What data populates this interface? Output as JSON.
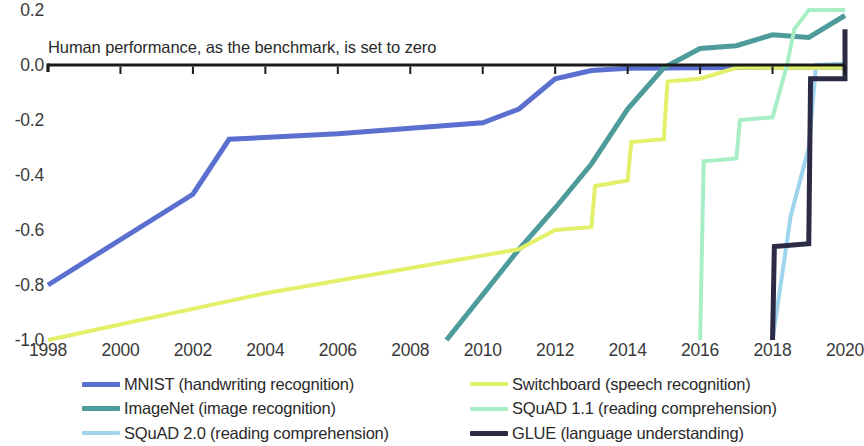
{
  "chart_data": {
    "type": "line",
    "title": "",
    "subtitle": "",
    "annotation": "Human performance, as the benchmark, is set to zero",
    "xlabel": "",
    "ylabel": "",
    "xlim": [
      1998,
      2020
    ],
    "ylim": [
      -1.0,
      0.2
    ],
    "grid": false,
    "legend_position": "bottom",
    "xticks": [
      "1998",
      "2000",
      "2002",
      "2004",
      "2006",
      "2008",
      "2010",
      "2012",
      "2014",
      "2016",
      "2018",
      "2020"
    ],
    "xtick_values": [
      1998,
      2000,
      2002,
      2004,
      2006,
      2008,
      2010,
      2012,
      2014,
      2016,
      2018,
      2020
    ],
    "yticks": [
      "0.2",
      "0.0",
      "-0.2",
      "-0.4",
      "-0.6",
      "-0.8",
      "-1.0"
    ],
    "ytick_values": [
      0.2,
      0.0,
      -0.2,
      -0.4,
      -0.6,
      -0.8,
      -1.0
    ],
    "zero_line": 0.0,
    "series": [
      {
        "name": "MNIST (handwriting recognition)",
        "color": "#5b6fd0",
        "x": [
          1998,
          2002,
          2003,
          2006,
          2010,
          2011,
          2012,
          2013,
          2014,
          2016,
          2018,
          2020
        ],
        "y": [
          -0.8,
          -0.47,
          -0.27,
          -0.25,
          -0.21,
          -0.16,
          -0.05,
          -0.02,
          -0.012,
          -0.01,
          -0.008,
          -0.008
        ]
      },
      {
        "name": "ImageNet (image recognition)",
        "color": "#4d9b9b",
        "x": [
          2009,
          2011,
          2012,
          2013,
          2014,
          2015,
          2016,
          2017,
          2018,
          2019,
          2020
        ],
        "y": [
          -1.0,
          -0.67,
          -0.52,
          -0.36,
          -0.16,
          -0.01,
          0.06,
          0.07,
          0.11,
          0.1,
          0.18
        ]
      },
      {
        "name": "SQuAD 2.0 (reading comprehension)",
        "color": "#9fd4ef",
        "x": [
          2018,
          2018.5,
          2019,
          2019.2,
          2020
        ],
        "y": [
          -1.0,
          -0.55,
          -0.3,
          0.0,
          0.005
        ]
      },
      {
        "name": "Switchboard (speech recognition)",
        "color": "#e3f06a",
        "x": [
          1998,
          2004,
          2011,
          2012,
          2013,
          2013.1,
          2014,
          2014.1,
          2015,
          2015.1,
          2016,
          2017,
          2020
        ],
        "y": [
          -1.0,
          -0.83,
          -0.67,
          -0.6,
          -0.59,
          -0.44,
          -0.42,
          -0.28,
          -0.27,
          -0.06,
          -0.05,
          -0.01,
          -0.01
        ]
      },
      {
        "name": "SQuAD 1.1 (reading comprehension)",
        "color": "#a8eec4",
        "x": [
          2016,
          2016.1,
          2017,
          2017.1,
          2018,
          2018.4,
          2018.6,
          2019,
          2020
        ],
        "y": [
          -1.0,
          -0.35,
          -0.34,
          -0.2,
          -0.19,
          0.0,
          0.13,
          0.2,
          0.2
        ]
      },
      {
        "name": "GLUE (language understanding)",
        "color": "#2b2b45",
        "x": [
          2018,
          2018.05,
          2019,
          2019.05,
          2020,
          2020.0
        ],
        "y": [
          -1.0,
          -0.66,
          -0.65,
          -0.05,
          -0.05,
          0.13
        ]
      }
    ]
  },
  "axis": {
    "yticks": [
      {
        "label": "0.2",
        "value": 0.2
      },
      {
        "label": "0.0",
        "value": 0.0
      },
      {
        "label": "-0.2",
        "value": -0.2
      },
      {
        "label": "-0.4",
        "value": -0.4
      },
      {
        "label": "-0.6",
        "value": -0.6
      },
      {
        "label": "-0.8",
        "value": -0.8
      },
      {
        "label": "-1.0",
        "value": -1.0
      }
    ],
    "xticks": [
      {
        "label": "1998",
        "value": 1998
      },
      {
        "label": "2000",
        "value": 2000
      },
      {
        "label": "2002",
        "value": 2002
      },
      {
        "label": "2004",
        "value": 2004
      },
      {
        "label": "2006",
        "value": 2006
      },
      {
        "label": "2008",
        "value": 2008
      },
      {
        "label": "2010",
        "value": 2010
      },
      {
        "label": "2012",
        "value": 2012
      },
      {
        "label": "2014",
        "value": 2014
      },
      {
        "label": "2016",
        "value": 2016
      },
      {
        "label": "2018",
        "value": 2018
      },
      {
        "label": "2020",
        "value": 2020
      }
    ]
  },
  "annotation": {
    "text": "Human performance, as the benchmark, is set to zero"
  },
  "legend": {
    "left_column": [
      {
        "label": "MNIST (handwriting recognition)",
        "color": "#5b6fd0",
        "thickness": 5
      },
      {
        "label": "ImageNet (image recognition)",
        "color": "#4d9b9b",
        "thickness": 5
      },
      {
        "label": "SQuAD 2.0 (reading comprehension)",
        "color": "#9fd4ef",
        "thickness": 4
      }
    ],
    "right_column": [
      {
        "label": "Switchboard (speech recognition)",
        "color": "#e3f06a",
        "thickness": 4
      },
      {
        "label": "SQuAD 1.1 (reading comprehension)",
        "color": "#a8eec4",
        "thickness": 4
      },
      {
        "label": "GLUE (language understanding)",
        "color": "#2b2b45",
        "thickness": 5
      }
    ]
  }
}
